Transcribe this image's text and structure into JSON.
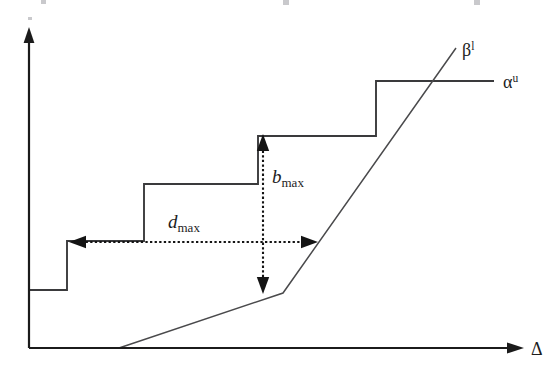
{
  "figure": {
    "background_color": "#ffffff",
    "stroke_color": "#3a3a3c",
    "axis_color": "#1b1b1b",
    "dimension_color": "#141414"
  },
  "axes": {
    "x_axis": {
      "label": "Δ",
      "label_name": "delta",
      "origin": [
        29,
        348
      ],
      "end": [
        523,
        348
      ],
      "arrow": "right"
    },
    "y_axis": {
      "label": "",
      "origin": [
        29,
        348
      ],
      "end": [
        29,
        32
      ],
      "arrow": "up"
    }
  },
  "curves": [
    {
      "name": "arrival-curve",
      "label": "α",
      "label_superscript": "u",
      "label_full": "αᵘ",
      "type": "staircase",
      "label_position": [
        503,
        88
      ],
      "points": [
        [
          29,
          348
        ],
        [
          29,
          290
        ],
        [
          67,
          290
        ],
        [
          67,
          241
        ],
        [
          144,
          241
        ],
        [
          144,
          184
        ],
        [
          258,
          184
        ],
        [
          258,
          136
        ],
        [
          376,
          136
        ],
        [
          376,
          81
        ],
        [
          494,
          81
        ]
      ]
    },
    {
      "name": "service-curve",
      "label": "β",
      "label_superscript": "l",
      "label_full": "βˡ",
      "type": "piecewise-linear",
      "label_position": [
        462,
        56
      ],
      "points": [
        [
          119,
          348
        ],
        [
          283,
          293
        ],
        [
          456,
          48
        ]
      ]
    }
  ],
  "annotations": [
    {
      "name": "d-max",
      "label": "d",
      "label_subscript": "max",
      "label_full": "d_max",
      "orientation": "horizontal",
      "label_position": [
        168,
        228
      ],
      "from": [
        69,
        242
      ],
      "to": [
        318,
        242
      ],
      "arrowheads": "both",
      "style": "dotted"
    },
    {
      "name": "b-max",
      "label": "b",
      "label_subscript": "max",
      "label_full": "b_max",
      "orientation": "vertical",
      "label_position": [
        272,
        183
      ],
      "from": [
        263,
        134
      ],
      "to": [
        263,
        294
      ],
      "arrowheads": "both",
      "style": "dotted"
    }
  ]
}
